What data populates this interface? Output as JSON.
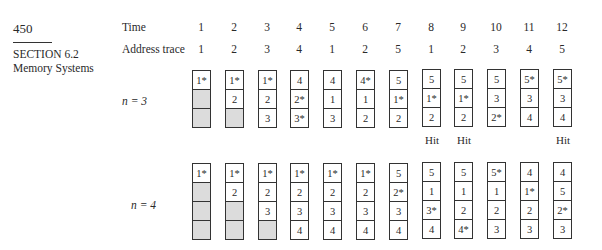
{
  "header": {
    "page_number": "450",
    "section": "SECTION 6.2",
    "section_title": "Memory Systems"
  },
  "labels": {
    "time": "Time",
    "address_trace": "Address trace",
    "n3": "n = 3",
    "n4": "n = 4",
    "hit": "Hit"
  },
  "time": [
    "1",
    "2",
    "3",
    "4",
    "5",
    "6",
    "7",
    "8",
    "9",
    "10",
    "11",
    "12"
  ],
  "address_trace": [
    "1",
    "2",
    "3",
    "4",
    "1",
    "2",
    "5",
    "1",
    "2",
    "3",
    "4",
    "5"
  ],
  "n3": {
    "columns": [
      [
        "1*",
        "",
        ""
      ],
      [
        "1*",
        "2",
        ""
      ],
      [
        "1*",
        "2",
        "3"
      ],
      [
        "4",
        "2*",
        "3*"
      ],
      [
        "4",
        "1",
        "3"
      ],
      [
        "4*",
        "1",
        "2"
      ],
      [
        "5",
        "1*",
        "2"
      ],
      [
        "5",
        "1*",
        "2"
      ],
      [
        "5",
        "1*",
        "2"
      ],
      [
        "5",
        "3",
        "2*"
      ],
      [
        "5*",
        "3",
        "4"
      ],
      [
        "5*",
        "3",
        "4"
      ]
    ],
    "hits": [
      "",
      "",
      "",
      "",
      "",
      "",
      "",
      "Hit",
      "Hit",
      "",
      "",
      "Hit"
    ]
  },
  "n4": {
    "columns": [
      [
        "1*",
        "",
        "",
        ""
      ],
      [
        "1*",
        "2",
        "",
        ""
      ],
      [
        "1*",
        "2",
        "3",
        ""
      ],
      [
        "1*",
        "2",
        "3",
        "4"
      ],
      [
        "1*",
        "2",
        "3",
        "4"
      ],
      [
        "1*",
        "2",
        "3",
        "4"
      ],
      [
        "5",
        "2*",
        "3",
        "4"
      ],
      [
        "5",
        "1",
        "3*",
        "4"
      ],
      [
        "5",
        "1",
        "2",
        "4*"
      ],
      [
        "5*",
        "1",
        "2",
        "3"
      ],
      [
        "4",
        "1*",
        "2",
        "3"
      ],
      [
        "4",
        "5",
        "2*",
        "3"
      ]
    ],
    "hits": [
      "",
      "",
      "",
      "",
      "",
      "",
      "",
      "",
      "",
      "",
      "",
      ""
    ]
  },
  "colors": {
    "empty_cell": "#dcdcdc",
    "border": "#333333",
    "text": "#2a2a2a"
  }
}
